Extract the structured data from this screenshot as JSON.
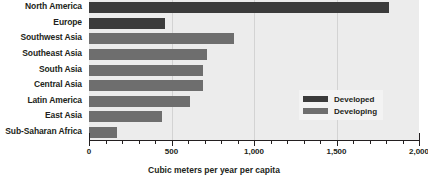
{
  "chart_data": {
    "type": "bar",
    "orientation": "horizontal",
    "title": "",
    "xlabel": "Cubic meters per year per capita",
    "ylabel": "",
    "xlim": [
      0,
      2000
    ],
    "xticks": [
      0,
      500,
      1000,
      1500,
      2000
    ],
    "xtick_labels": [
      "0",
      "500",
      "1,000",
      "1,500",
      "2,000"
    ],
    "grid": true,
    "grid_axis": "x",
    "legend_position": "center-right",
    "categories": [
      "North America",
      "Europe",
      "Southwest Asia",
      "Southeast Asia",
      "South Asia",
      "Central Asia",
      "Latin America",
      "East Asia",
      "Sub-Saharan Africa"
    ],
    "values": [
      1820,
      460,
      880,
      715,
      690,
      690,
      610,
      440,
      170
    ],
    "groups": [
      "Developed",
      "Developed",
      "Developing",
      "Developing",
      "Developing",
      "Developing",
      "Developing",
      "Developing",
      "Developing"
    ],
    "series": [
      {
        "name": "Developed",
        "color": "#3b3b3b",
        "points": [
          {
            "category": "North America",
            "value": 1820
          },
          {
            "category": "Europe",
            "value": 460
          }
        ]
      },
      {
        "name": "Developing",
        "color": "#6e6e6e",
        "points": [
          {
            "category": "Southwest Asia",
            "value": 880
          },
          {
            "category": "Southeast Asia",
            "value": 715
          },
          {
            "category": "South Asia",
            "value": 690
          },
          {
            "category": "Central Asia",
            "value": 690
          },
          {
            "category": "Latin America",
            "value": 610
          },
          {
            "category": "East Asia",
            "value": 440
          },
          {
            "category": "Sub-Saharan Africa",
            "value": 170
          }
        ]
      }
    ]
  },
  "legend": {
    "items": [
      {
        "label": "Developed",
        "color": "#3b3b3b"
      },
      {
        "label": "Developing",
        "color": "#6e6e6e"
      }
    ]
  },
  "colors": {
    "developed": "#3b3b3b",
    "developing": "#6e6e6e",
    "plot_background": "#ececec",
    "gridline": "#d3d3d3",
    "axis": "#231f20",
    "text": "#231f20",
    "legend_background": "#f3f3f3"
  }
}
